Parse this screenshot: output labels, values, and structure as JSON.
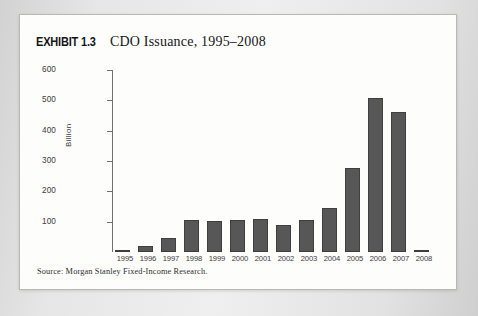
{
  "exhibit": {
    "tag": "EXHIBIT 1.3",
    "title": "CDO Issuance, 1995–2008",
    "source": "Source: Morgan Stanley Fixed-Income Research."
  },
  "colors": {
    "bar_fill": "#575757",
    "bar_edge": "#3f3f3f",
    "axis": "#6f6f6f",
    "frame": "#b8b8b4",
    "paper": "#fdfdfb",
    "page_background": "#d9d9d9"
  },
  "chart_data": {
    "type": "bar",
    "title": "CDO Issuance, 1995–2008",
    "xlabel": "",
    "ylabel": "Billion",
    "ylim": [
      0,
      600
    ],
    "yticks": [
      100,
      200,
      300,
      400,
      500,
      600
    ],
    "ytick_labels": [
      "100",
      "200",
      "300",
      "400",
      "500",
      "600"
    ],
    "grid": false,
    "legend": "none",
    "categories": [
      "1995",
      "1996",
      "1997",
      "1998",
      "1999",
      "2000",
      "2001",
      "2002",
      "2003",
      "2004",
      "2005",
      "2006",
      "2007",
      "2008"
    ],
    "values": [
      2,
      20,
      47,
      107,
      103,
      104,
      110,
      88,
      105,
      145,
      278,
      507,
      460,
      3
    ]
  }
}
